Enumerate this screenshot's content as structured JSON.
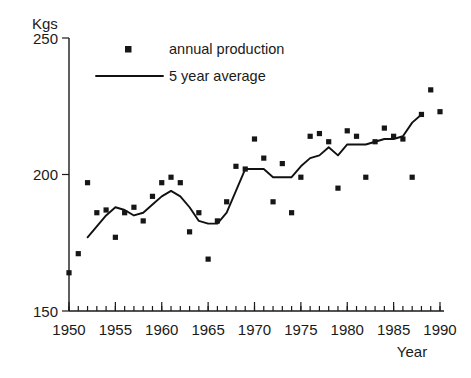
{
  "chart_data": {
    "type": "scatter",
    "title": "",
    "xlabel": "Year",
    "ylabel": "Kgs",
    "xlim": [
      1950,
      1990
    ],
    "ylim": [
      150,
      250
    ],
    "grid": false,
    "legend_position": "top-center",
    "y_ticks": [
      150,
      200,
      250
    ],
    "y_tick_labels": [
      "150",
      "200",
      "250"
    ],
    "x_ticks": [
      1950,
      1955,
      1960,
      1965,
      1970,
      1975,
      1980,
      1985,
      1990
    ],
    "x_tick_labels": [
      "1950",
      "1955",
      "1960",
      "1965",
      "1970",
      "1975",
      "1980",
      "1985",
      "1990"
    ],
    "x_minor_tick_step": 1,
    "series": [
      {
        "name": "annual production",
        "type": "scatter",
        "marker": "square",
        "color": "#161616",
        "x": [
          1950,
          1951,
          1952,
          1953,
          1954,
          1955,
          1956,
          1957,
          1958,
          1959,
          1960,
          1961,
          1962,
          1963,
          1964,
          1965,
          1966,
          1967,
          1968,
          1969,
          1970,
          1971,
          1972,
          1973,
          1974,
          1975,
          1976,
          1977,
          1978,
          1979,
          1980,
          1981,
          1982,
          1983,
          1984,
          1985,
          1986,
          1987,
          1988,
          1989,
          1990
        ],
        "values": [
          164,
          171,
          197,
          186,
          187,
          177,
          186,
          188,
          183,
          192,
          197,
          199,
          197,
          179,
          186,
          169,
          183,
          190,
          203,
          202,
          213,
          206,
          190,
          204,
          186,
          199,
          214,
          215,
          212,
          195,
          216,
          214,
          199,
          212,
          217,
          214,
          213,
          199,
          222,
          231,
          223
        ]
      },
      {
        "name": "5 year average",
        "type": "line",
        "color": "#111111",
        "x": [
          1952,
          1953,
          1954,
          1955,
          1956,
          1957,
          1958,
          1959,
          1960,
          1961,
          1962,
          1963,
          1964,
          1965,
          1966,
          1967,
          1968,
          1969,
          1970,
          1971,
          1972,
          1973,
          1974,
          1975,
          1976,
          1977,
          1978,
          1979,
          1980,
          1981,
          1982,
          1983,
          1984,
          1985,
          1986,
          1987,
          1988
        ],
        "values": [
          177,
          181,
          185,
          188,
          187,
          185,
          186,
          189,
          192,
          194,
          192,
          188,
          183,
          182,
          182,
          186,
          194,
          202,
          202,
          202,
          199,
          199,
          199,
          203,
          206,
          207,
          210,
          207,
          211,
          211,
          211,
          212,
          213,
          213,
          214,
          219,
          222
        ]
      }
    ],
    "legend": [
      {
        "label": "annual production",
        "marker": "square"
      },
      {
        "label": "5 year average",
        "marker": "line"
      }
    ]
  },
  "axis": {
    "y_title": "Kgs",
    "x_title": "Year"
  }
}
